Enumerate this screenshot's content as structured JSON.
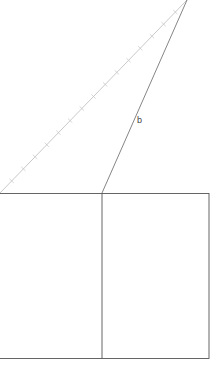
{
  "diagram": {
    "labels": {
      "side_b": "b"
    },
    "colors": {
      "hatched_line": "#bbbbbb",
      "line": "#666666",
      "rect": "#555555"
    },
    "points": {
      "apex": [
        187,
        0
      ],
      "left": [
        0,
        193
      ],
      "base_vertex": [
        102,
        193
      ]
    },
    "rectangle": {
      "x": -1,
      "y": 193,
      "width": 210,
      "height": 165,
      "divider_x": 102
    },
    "tick_count": 15
  }
}
